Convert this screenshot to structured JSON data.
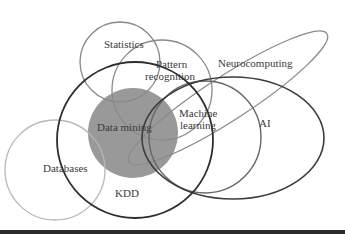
{
  "diagram": {
    "type": "venn",
    "title": "",
    "sets": [
      {
        "id": "statistics",
        "label": "Statistics",
        "shape": "circle",
        "cx": 120,
        "cy": 62,
        "r": 40,
        "stroke": "#8a8a8a",
        "fill": "none"
      },
      {
        "id": "pattern_recognition",
        "label_line1": "Pattern",
        "label_line2": "recognition",
        "shape": "circle",
        "cx": 162,
        "cy": 90,
        "r": 50,
        "stroke": "#8a8a8a",
        "fill": "none"
      },
      {
        "id": "neurocomputing",
        "label": "Neurocomputing",
        "shape": "ellipse",
        "stroke": "#8a8a8a",
        "fill": "none"
      },
      {
        "id": "data_mining",
        "label": "Data mining",
        "shape": "circle",
        "cx": 133,
        "cy": 133,
        "r": 45,
        "stroke": "none",
        "fill": "#999999"
      },
      {
        "id": "kdd",
        "label": "KDD",
        "shape": "circle",
        "cx": 135,
        "cy": 140,
        "r": 78,
        "stroke": "#2e2e2e",
        "fill": "none"
      },
      {
        "id": "databases",
        "label": "Databases",
        "shape": "circle",
        "cx": 55,
        "cy": 170,
        "r": 50,
        "stroke": "#b8b8b8",
        "fill": "none"
      },
      {
        "id": "machine_learning",
        "label_line1": "Machine",
        "label_line2": "learning",
        "shape": "circle",
        "cx": 205,
        "cy": 137,
        "r": 56,
        "stroke": "#666666",
        "fill": "none"
      },
      {
        "id": "ai",
        "label": "AI",
        "shape": "ellipse",
        "cx": 233,
        "cy": 138,
        "rx": 91,
        "ry": 61,
        "stroke": "#3c3c3c",
        "fill": "none"
      }
    ],
    "colors": {
      "background": "#ffffff",
      "data_mining_fill": "#999999",
      "bottom_rule": "#2a2a2a"
    }
  }
}
